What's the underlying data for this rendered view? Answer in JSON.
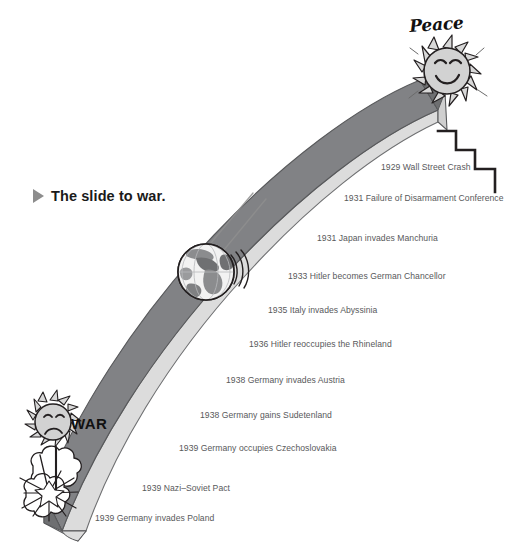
{
  "title": {
    "bullet_icon": "triangle-right-icon",
    "text": "The slide to war."
  },
  "endpoints": {
    "top": {
      "label": "Peace",
      "icon": "smiling-sun-icon"
    },
    "bottom": {
      "label": "WAR",
      "icon": "sad-sun-icon",
      "secondary_icon": "explosion-burst-icon"
    }
  },
  "slide": {
    "globe_icon": "globe-icon",
    "motion_icon": "motion-streak-icon",
    "staircase_icon": "staircase-icon",
    "colors": {
      "dark_band": "#818285",
      "light_band": "#dcdcdc",
      "edge_line": "#58595b",
      "outline": "#231f20"
    }
  },
  "chart_data": {
    "type": "timeline",
    "title": "The slide to war.",
    "orientation": "descending-slide",
    "axis_start_label": "Peace",
    "axis_end_label": "WAR",
    "events": [
      {
        "year": "1929",
        "text": "1929 Wall Street Crash",
        "x": 381,
        "y": 163
      },
      {
        "year": "1931",
        "text": "1931 Failure of Disarmament Conference",
        "x": 344,
        "y": 194
      },
      {
        "year": "1931",
        "text": "1931 Japan invades Manchuria",
        "x": 317,
        "y": 234
      },
      {
        "year": "1933",
        "text": "1933 Hitler becomes German Chancellor",
        "x": 288,
        "y": 272
      },
      {
        "year": "1935",
        "text": "1935 Italy invades Abyssinia",
        "x": 268,
        "y": 306
      },
      {
        "year": "1936",
        "text": "1936 Hitler reoccupies the Rhineland",
        "x": 249,
        "y": 340
      },
      {
        "year": "1938",
        "text": "1938 Germany invades Austria",
        "x": 226,
        "y": 376
      },
      {
        "year": "1938",
        "text": "1938 Germany gains Sudetenland",
        "x": 200,
        "y": 411
      },
      {
        "year": "1939",
        "text": "1939 Germany occupies Czechoslovakia",
        "x": 179,
        "y": 444
      },
      {
        "year": "1939",
        "text": "1939 Nazi–Soviet Pact",
        "x": 142,
        "y": 484
      },
      {
        "year": "1939",
        "text": "1939 Germany invades Poland",
        "x": 95,
        "y": 514
      }
    ]
  }
}
